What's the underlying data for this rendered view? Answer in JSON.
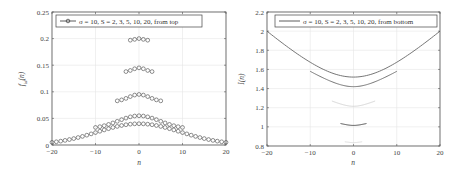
{
  "chart_data": [
    {
      "type": "scatter",
      "title": "",
      "xlabel": "n",
      "ylabel": "f_{id}(n)",
      "xlim": [
        -20,
        20
      ],
      "ylim": [
        0,
        0.25
      ],
      "xticks": [
        -20,
        -10,
        0,
        10,
        20
      ],
      "yticks": [
        0,
        0.05,
        0.1,
        0.15,
        0.2,
        0.25
      ],
      "ytick_labels": [
        "0",
        "0.05",
        "0.1",
        "0.15",
        "0.2",
        "0.25"
      ],
      "grid": true,
      "legend": {
        "position": "top-left",
        "entries": [
          "σ = 10, S = 2, 3, 5, 10, 20, from top"
        ]
      },
      "marker": "circle-open",
      "series": [
        {
          "name": "S = 2",
          "S": 2,
          "n_range": [
            -2,
            2
          ],
          "peak": 0.2,
          "edge": 0.197
        },
        {
          "name": "S = 3",
          "S": 3,
          "n_range": [
            -3,
            3
          ],
          "peak": 0.145,
          "edge": 0.138
        },
        {
          "name": "S = 5",
          "S": 5,
          "n_range": [
            -5,
            5
          ],
          "peak": 0.095,
          "edge": 0.083
        },
        {
          "name": "S = 10",
          "S": 10,
          "n_range": [
            -10,
            10
          ],
          "peak": 0.055,
          "edge": 0.033
        },
        {
          "name": "S = 20",
          "S": 20,
          "n_range": [
            -20,
            20
          ],
          "peak": 0.04,
          "edge": 0.005
        }
      ]
    },
    {
      "type": "line",
      "title": "",
      "xlabel": "n",
      "ylabel": "I(n)",
      "xlim": [
        -20,
        20
      ],
      "ylim": [
        0.8,
        2.2
      ],
      "xticks": [
        -20,
        -10,
        0,
        10,
        20
      ],
      "yticks": [
        0.8,
        1,
        1.2,
        1.4,
        1.6,
        1.8,
        2,
        2.2
      ],
      "ytick_labels": [
        "0.8",
        "1",
        "1.2",
        "1.4",
        "1.6",
        "1.8",
        "2",
        "2.2"
      ],
      "grid": true,
      "legend": {
        "position": "top-right",
        "entries": [
          "σ = 10, S = 2, 3, 5, 10, 20, from bottom"
        ]
      },
      "series": [
        {
          "name": "S = 2",
          "S": 2,
          "n_range": [
            -2,
            2
          ],
          "min": 0.835,
          "edge": 0.845,
          "color": "#d8d8d8"
        },
        {
          "name": "S = 3",
          "S": 3,
          "n_range": [
            -3,
            3
          ],
          "min": 1.015,
          "edge": 1.035,
          "color": "#333333"
        },
        {
          "name": "S = 5",
          "S": 5,
          "n_range": [
            -5,
            5
          ],
          "min": 1.215,
          "edge": 1.27,
          "color": "#d0d0d0"
        },
        {
          "name": "S = 10",
          "S": 10,
          "n_range": [
            -10,
            10
          ],
          "min": 1.42,
          "edge": 1.58,
          "color": "#666666"
        },
        {
          "name": "S = 20",
          "S": 20,
          "n_range": [
            -20,
            20
          ],
          "min": 1.52,
          "edge": 2.0,
          "color": "#666666"
        }
      ]
    }
  ],
  "left": {
    "legend_text": "σ = 10, S = 2, 3, 5, 10, 20, from top",
    "xlabel": "n",
    "ylabel": "f",
    "ylabel_sub": "id",
    "ylabel_arg": "(n)",
    "xtick_labels": [
      "-20",
      "-10",
      "0",
      "10",
      "20"
    ],
    "ytick_labels": [
      "0",
      "0.05",
      "0.1",
      "0.15",
      "0.2",
      "0.25"
    ]
  },
  "right": {
    "legend_text": "σ = 10, S = 2, 3, 5, 10, 20, from bottom",
    "xlabel": "n",
    "ylabel": "I(n)",
    "xtick_labels": [
      "-20",
      "-10",
      "0",
      "10",
      "20"
    ],
    "ytick_labels": [
      "0.8",
      "1",
      "1.2",
      "1.4",
      "1.6",
      "1.8",
      "2",
      "2.2"
    ]
  }
}
